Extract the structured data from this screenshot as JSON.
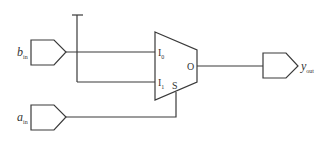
{
  "diagram": {
    "type": "multiplexer-circuit",
    "inputs": [
      {
        "name": "b",
        "subscript": "in"
      },
      {
        "name": "a",
        "subscript": "in"
      }
    ],
    "output": {
      "name": "y",
      "subscript": "out"
    },
    "mux": {
      "inputs": [
        {
          "label": "I",
          "subscript": "0"
        },
        {
          "label": "I",
          "subscript": "1"
        }
      ],
      "select_label": "S",
      "output_label": "O"
    },
    "colors": {
      "stroke": "#3a3a3a",
      "background": "#ffffff"
    }
  }
}
